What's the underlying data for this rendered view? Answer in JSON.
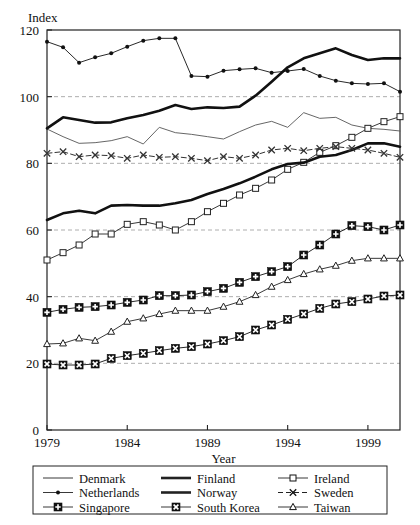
{
  "chart_data": {
    "type": "line",
    "title": "",
    "xlabel": "Year",
    "ylabel": "Index",
    "xlim": [
      1979,
      2001
    ],
    "ylim": [
      0,
      120
    ],
    "yticks": [
      0,
      20,
      40,
      60,
      80,
      100,
      120
    ],
    "xticks": [
      1979,
      1984,
      1989,
      1994,
      1999
    ],
    "gridlines": {
      "y": [
        20,
        40,
        60,
        80,
        100
      ],
      "style": "dashed",
      "color": "#999999"
    },
    "legend_position": "below-plot",
    "legend_columns": 3,
    "x": [
      1979,
      1980,
      1981,
      1982,
      1983,
      1984,
      1985,
      1986,
      1987,
      1988,
      1989,
      1990,
      1991,
      1992,
      1993,
      1994,
      1995,
      1996,
      1997,
      1998,
      1999,
      2000,
      2001
    ],
    "series": [
      {
        "name": "Denmark",
        "marker": "none",
        "line": "thin-solid",
        "color": "#555555",
        "values": [
          90.3,
          88.0,
          86.0,
          86.2,
          86.8,
          88.0,
          85.8,
          90.8,
          89.2,
          88.7,
          88.0,
          87.3,
          89.5,
          91.5,
          92.6,
          90.8,
          95.2,
          93.5,
          93.8,
          91.5,
          90.5,
          90.2,
          89.7
        ]
      },
      {
        "name": "Finland",
        "marker": "none",
        "line": "thick-solid",
        "color": "#111111",
        "values": [
          90.5,
          93.8,
          93.0,
          92.2,
          92.3,
          93.5,
          94.5,
          95.8,
          97.5,
          96.3,
          96.8,
          96.6,
          97.0,
          100.3,
          104.5,
          108.8,
          111.5,
          113.0,
          114.5,
          112.5,
          111.0,
          111.5,
          111.5
        ]
      },
      {
        "name": "Ireland",
        "marker": "open-square",
        "line": "thin-solid",
        "color": "#222222",
        "values": [
          51.0,
          53.2,
          55.5,
          58.8,
          58.8,
          61.7,
          62.5,
          61.5,
          60.0,
          62.5,
          65.5,
          68.0,
          70.5,
          72.5,
          75.0,
          78.2,
          80.3,
          83.3,
          85.3,
          87.8,
          90.5,
          92.5,
          94.0
        ]
      },
      {
        "name": "Netherlands",
        "marker": "filled-dot",
        "line": "thin-solid",
        "color": "#111111",
        "values": [
          116.5,
          114.8,
          110.2,
          111.8,
          113.0,
          115.0,
          116.8,
          117.5,
          117.5,
          106.2,
          106.0,
          107.8,
          108.2,
          108.5,
          107.2,
          107.7,
          108.3,
          106.2,
          104.8,
          104.0,
          103.8,
          104.0,
          101.5
        ]
      },
      {
        "name": "Norway",
        "marker": "none",
        "line": "thick-solid",
        "color": "#111111",
        "values": [
          63.0,
          65.0,
          65.8,
          65.0,
          67.3,
          67.5,
          67.3,
          67.3,
          68.0,
          69.0,
          70.8,
          72.3,
          74.0,
          76.0,
          78.2,
          79.8,
          80.2,
          82.0,
          82.5,
          84.0,
          86.0,
          86.0,
          85.0
        ]
      },
      {
        "name": "Singapore",
        "marker": "filled-square-plus",
        "line": "thin-solid",
        "color": "#111111",
        "values": [
          35.3,
          36.2,
          36.8,
          37.0,
          37.5,
          38.3,
          39.0,
          40.3,
          40.3,
          40.5,
          41.5,
          42.5,
          44.3,
          46.0,
          47.5,
          49.0,
          52.5,
          55.5,
          58.8,
          61.3,
          61.0,
          60.0,
          61.5
        ]
      },
      {
        "name": "South Korea",
        "marker": "filled-square-x",
        "line": "thin-solid",
        "color": "#111111",
        "values": [
          19.8,
          19.5,
          19.5,
          19.8,
          21.5,
          22.3,
          23.0,
          23.8,
          24.5,
          25.0,
          25.8,
          26.8,
          28.0,
          30.0,
          31.5,
          33.2,
          34.8,
          36.5,
          37.8,
          38.5,
          39.3,
          40.2,
          40.5
        ]
      },
      {
        "name": "Sweden",
        "marker": "cross-x",
        "line": "thin-dashed",
        "color": "#333333",
        "values": [
          83.0,
          83.5,
          82.0,
          82.5,
          82.3,
          81.5,
          82.5,
          81.8,
          82.0,
          81.5,
          80.8,
          82.0,
          81.5,
          82.5,
          84.0,
          84.5,
          83.8,
          84.5,
          85.0,
          84.5,
          84.0,
          83.0,
          81.8
        ]
      },
      {
        "name": "Taiwan",
        "marker": "open-triangle",
        "line": "thin-solid",
        "color": "#222222",
        "values": [
          25.8,
          26.0,
          27.5,
          26.8,
          29.5,
          32.5,
          33.5,
          34.8,
          35.8,
          35.8,
          35.8,
          37.0,
          38.5,
          40.5,
          43.0,
          45.0,
          46.8,
          48.2,
          49.3,
          50.8,
          51.5,
          51.5,
          51.5
        ]
      }
    ],
    "legend": [
      {
        "name": "Denmark",
        "marker": "none",
        "line": "thin-solid"
      },
      {
        "name": "Finland",
        "marker": "none",
        "line": "thick-solid"
      },
      {
        "name": "Ireland",
        "marker": "open-square",
        "line": "thin-solid"
      },
      {
        "name": "Netherlands",
        "marker": "filled-dot",
        "line": "thin-solid"
      },
      {
        "name": "Norway",
        "marker": "none",
        "line": "thick-solid"
      },
      {
        "name": "Sweden",
        "marker": "cross-x",
        "line": "thin-dashed"
      },
      {
        "name": "Singapore",
        "marker": "filled-square-plus",
        "line": "thin-solid"
      },
      {
        "name": "South Korea",
        "marker": "filled-square-x",
        "line": "thin-solid"
      },
      {
        "name": "Taiwan",
        "marker": "open-triangle",
        "line": "thin-solid"
      }
    ]
  },
  "axes": {
    "ylabel": "Index",
    "xlabel": "Year",
    "ytick_labels": [
      "0",
      "20",
      "40",
      "60",
      "80",
      "100",
      "120"
    ],
    "xtick_labels": [
      "1979",
      "1984",
      "1989",
      "1994",
      "1999"
    ]
  }
}
